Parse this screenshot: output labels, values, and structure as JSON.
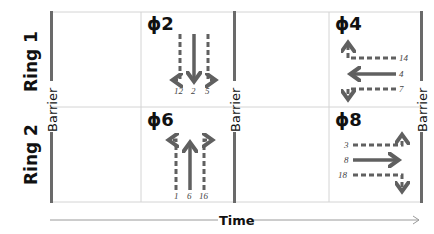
{
  "diagram": {
    "rings": [
      {
        "label": "Ring 1",
        "phases": [
          {
            "label": "ϕ2",
            "movements": {
              "left": "12",
              "through": "2",
              "right": "5"
            },
            "direction": "southbound"
          },
          {
            "label": "ϕ4",
            "movements": {
              "left": "14",
              "through": "4",
              "right": "7"
            },
            "direction": "westbound"
          }
        ]
      },
      {
        "label": "Ring 2",
        "phases": [
          {
            "label": "ϕ6",
            "movements": {
              "left": "1",
              "through": "6",
              "right": "16"
            },
            "direction": "northbound"
          },
          {
            "label": "ϕ8",
            "movements": {
              "left": "3",
              "through": "8",
              "right": "18"
            },
            "direction": "eastbound"
          }
        ]
      }
    ],
    "barriers": [
      "Barrier",
      "Barrier",
      "Barrier"
    ],
    "time_axis_label": "Time",
    "colors": {
      "arrow": "#606060",
      "barrier": "#6a6a6a",
      "grid": "#d0d0d0",
      "text": "#111111"
    }
  }
}
